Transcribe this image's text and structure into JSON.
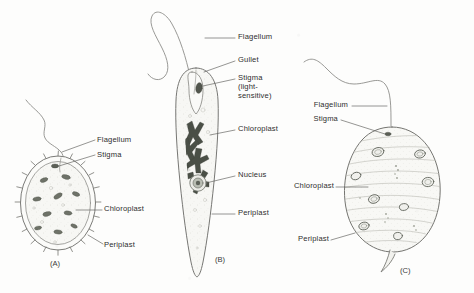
{
  "figure": {
    "background_color": "#fdfdfc",
    "ink_color": "#6f6f6f",
    "chloroplast_color": "#4a4f46",
    "text_color": "#2e2e2e"
  },
  "panels": [
    {
      "id": "A",
      "caption": "(A)",
      "labels": [
        {
          "name": "flagellum",
          "text": "Flagellum"
        },
        {
          "name": "stigma",
          "text": "Stigma"
        },
        {
          "name": "chloroplast",
          "text": "Chloroplast"
        },
        {
          "name": "periplast",
          "text": "Periplast"
        }
      ]
    },
    {
      "id": "B",
      "caption": "(B)",
      "labels": [
        {
          "name": "flagellum",
          "text": "Flagellum"
        },
        {
          "name": "gullet",
          "text": "Gullet"
        },
        {
          "name": "stigma",
          "text": "Stigma"
        },
        {
          "name": "stigma-note-1",
          "text": "(light-"
        },
        {
          "name": "stigma-note-2",
          "text": "sensitive)"
        },
        {
          "name": "chloroplast",
          "text": "Chloroplast"
        },
        {
          "name": "nucleus",
          "text": "Nucleus"
        },
        {
          "name": "periplast",
          "text": "Periplast"
        }
      ]
    },
    {
      "id": "C",
      "caption": "(C)",
      "labels": [
        {
          "name": "flagellum",
          "text": "Flagellum"
        },
        {
          "name": "stigma",
          "text": "Stigma"
        },
        {
          "name": "chloroplast",
          "text": "Chloroplast"
        },
        {
          "name": "periplast",
          "text": "Periplast"
        }
      ]
    }
  ]
}
